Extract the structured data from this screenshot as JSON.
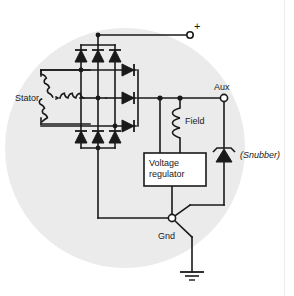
{
  "figure": {
    "background_color": "#ffffff",
    "disc_color": "#ebebeb",
    "line_color": "#1a1a1a",
    "border_color": "#e2e2e2"
  },
  "labels": {
    "stator": "Stator",
    "field": "Field",
    "aux": "Aux",
    "gnd": "Gnd",
    "plus": "+",
    "snubber": "(Snubber)",
    "regulator_line1": "Voltage",
    "regulator_line2": "regulator"
  },
  "components": {
    "stator_windings": 3,
    "stator_connection": "wye",
    "bridge_diodes_upper": 3,
    "bridge_diodes_lower": 3,
    "aux_diodes": 3,
    "snubber_type": "zener",
    "ground_symbol": "earth",
    "terminals": [
      "+",
      "Aux",
      "Gnd"
    ]
  }
}
